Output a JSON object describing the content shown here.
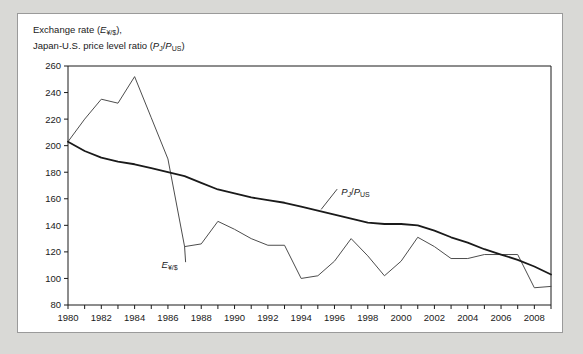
{
  "figure": {
    "axis_title_line1_prefix": "Exchange rate (",
    "axis_title_line1_symbol": "E",
    "axis_title_line1_sub": "¥/$",
    "axis_title_line1_suffix": "),",
    "axis_title_line2_prefix": "Japan-U.S. price level ratio (",
    "axis_title_line2_sym1": "P",
    "axis_title_line2_sub1": "J",
    "axis_title_line2_slash": "/",
    "axis_title_line2_sym2": "P",
    "axis_title_line2_sub2": "US",
    "axis_title_line2_suffix": ")",
    "frame_color": "#9a9a9a",
    "background": "#ffffff",
    "page_background": "#d9d9d6"
  },
  "chart_data": {
    "type": "line",
    "title": "",
    "xlabel": "",
    "ylabel": "Exchange rate (E¥/$), Japan-U.S. price level ratio (PJ/PUS)",
    "xlim": [
      1980,
      2009
    ],
    "ylim": [
      80,
      260
    ],
    "ytick_step": 20,
    "yticks": [
      80,
      100,
      120,
      140,
      160,
      180,
      200,
      220,
      240,
      260
    ],
    "xticks": [
      1980,
      1981,
      1982,
      1983,
      1984,
      1985,
      1986,
      1987,
      1988,
      1989,
      1990,
      1991,
      1992,
      1993,
      1994,
      1995,
      1996,
      1997,
      1998,
      1999,
      2000,
      2001,
      2002,
      2003,
      2004,
      2005,
      2006,
      2007,
      2008,
      2009
    ],
    "xtick_labels": [
      1980,
      1982,
      1984,
      1986,
      1988,
      1990,
      1992,
      1994,
      1996,
      1998,
      2000,
      2002,
      2004,
      2006,
      2008
    ],
    "grid": false,
    "legend_position": "inline-annotations",
    "x": [
      1980,
      1981,
      1982,
      1983,
      1984,
      1985,
      1986,
      1987,
      1988,
      1989,
      1990,
      1991,
      1992,
      1993,
      1994,
      1995,
      1996,
      1997,
      1998,
      1999,
      2000,
      2001,
      2002,
      2003,
      2004,
      2005,
      2006,
      2007,
      2008,
      2009
    ],
    "series": [
      {
        "name": "E¥/$",
        "label": "E",
        "label_sub": "¥/$",
        "color": "#4d4d4d",
        "width": 1,
        "values": [
          203,
          220,
          235,
          232,
          252,
          221,
          190,
          124,
          126,
          143,
          137,
          130,
          125,
          125,
          100,
          102,
          113,
          130,
          117,
          102,
          113,
          131,
          124,
          115,
          115,
          118,
          118,
          118,
          93,
          94
        ]
      },
      {
        "name": "PJ/PUS",
        "label_sym1": "P",
        "label_sub1": "J",
        "label_slash": "/",
        "label_sym2": "P",
        "label_sub2": "US",
        "color": "#1a1a1a",
        "width": 1.8,
        "values": [
          203,
          196,
          191,
          188,
          186,
          183,
          180,
          177,
          172,
          167,
          164,
          161,
          159,
          157,
          154,
          151,
          148,
          145,
          142,
          141,
          141,
          140,
          136,
          131,
          127,
          122,
          118,
          114,
          109,
          103
        ]
      }
    ],
    "annotations": [
      {
        "text": "E¥/$",
        "x": 1986.1,
        "y": 110,
        "leader_to_x": 1987.0,
        "leader_to_y": 124
      },
      {
        "text": "PJ/PUS",
        "x": 1996.4,
        "y": 165,
        "leader_to_x": 1995.2,
        "leader_to_y": 152
      }
    ]
  }
}
